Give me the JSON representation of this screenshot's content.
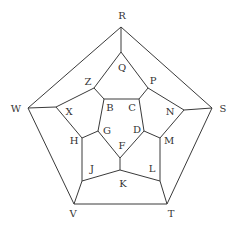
{
  "diagram": {
    "type": "dodecahedron-graph",
    "vertices": {
      "R": [
        121,
        27
      ],
      "W": [
        28,
        108
      ],
      "S": [
        212,
        108
      ],
      "V": [
        74,
        204
      ],
      "T": [
        167,
        204
      ],
      "Q": [
        121,
        52
      ],
      "Z": [
        94,
        88
      ],
      "P": [
        148,
        88
      ],
      "X": [
        56,
        107
      ],
      "N": [
        184,
        110
      ],
      "B": [
        104,
        99
      ],
      "C": [
        139,
        99
      ],
      "G": [
        98,
        131
      ],
      "D": [
        144,
        131
      ],
      "H": [
        82,
        138
      ],
      "M": [
        160,
        138
      ],
      "F": [
        120,
        158
      ],
      "J": [
        82,
        181
      ],
      "L": [
        160,
        181
      ],
      "K": [
        120,
        170
      ]
    },
    "edges": [
      [
        "R",
        "W"
      ],
      [
        "R",
        "S"
      ],
      [
        "R",
        "Q"
      ],
      [
        "W",
        "V"
      ],
      [
        "S",
        "T"
      ],
      [
        "V",
        "T"
      ],
      [
        "W",
        "X"
      ],
      [
        "S",
        "N"
      ],
      [
        "V",
        "J"
      ],
      [
        "T",
        "L"
      ],
      [
        "Q",
        "Z"
      ],
      [
        "Q",
        "P"
      ],
      [
        "Z",
        "X"
      ],
      [
        "P",
        "N"
      ],
      [
        "Z",
        "B"
      ],
      [
        "P",
        "C"
      ],
      [
        "B",
        "C"
      ],
      [
        "B",
        "G"
      ],
      [
        "C",
        "D"
      ],
      [
        "X",
        "H"
      ],
      [
        "N",
        "M"
      ],
      [
        "H",
        "G"
      ],
      [
        "M",
        "D"
      ],
      [
        "H",
        "J"
      ],
      [
        "M",
        "L"
      ],
      [
        "G",
        "F"
      ],
      [
        "D",
        "F"
      ],
      [
        "F",
        "K"
      ],
      [
        "J",
        "K"
      ],
      [
        "L",
        "K"
      ]
    ],
    "labels": [
      {
        "text": "R",
        "x": 122,
        "y": 16
      },
      {
        "text": "Q",
        "x": 122,
        "y": 68
      },
      {
        "text": "Z",
        "x": 88,
        "y": 82
      },
      {
        "text": "P",
        "x": 153,
        "y": 81
      },
      {
        "text": "W",
        "x": 16,
        "y": 109
      },
      {
        "text": "S",
        "x": 223,
        "y": 109
      },
      {
        "text": "X",
        "x": 69,
        "y": 112
      },
      {
        "text": "N",
        "x": 170,
        "y": 112
      },
      {
        "text": "B",
        "x": 110,
        "y": 108
      },
      {
        "text": "C",
        "x": 132,
        "y": 108
      },
      {
        "text": "G",
        "x": 107,
        "y": 131
      },
      {
        "text": "D",
        "x": 137,
        "y": 130
      },
      {
        "text": "H",
        "x": 74,
        "y": 141
      },
      {
        "text": "M",
        "x": 169,
        "y": 141
      },
      {
        "text": "F",
        "x": 122,
        "y": 146
      },
      {
        "text": "J",
        "x": 92,
        "y": 169
      },
      {
        "text": "L",
        "x": 152,
        "y": 169
      },
      {
        "text": "K",
        "x": 123,
        "y": 184
      },
      {
        "text": "V",
        "x": 73,
        "y": 214
      },
      {
        "text": "T",
        "x": 171,
        "y": 214
      }
    ]
  }
}
